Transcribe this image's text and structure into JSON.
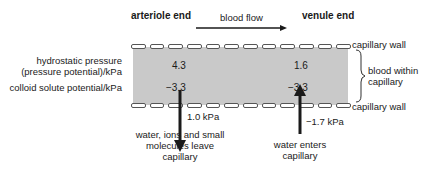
{
  "diagram": {
    "headers": {
      "arteriole": "arteriole end",
      "flow": "blood flow",
      "venule": "venule end"
    },
    "row_labels": {
      "hydrostatic_line1": "hydrostatic pressure",
      "hydrostatic_line2": "(pressure potential)/kPa",
      "colloid": "colloid solute potential/kPa"
    },
    "values": {
      "arteriole_hydrostatic": "4.3",
      "arteriole_colloid": "−3.3",
      "venule_hydrostatic": "1.6",
      "venule_colloid": "−3.3"
    },
    "side_labels": {
      "wall_top": "capillary wall",
      "blood_line1": "blood within",
      "blood_line2": "capillary",
      "wall_bottom": "capillary wall"
    },
    "arrows": {
      "out_pressure": "1.0 kPa",
      "in_pressure": "−1.7 kPa"
    },
    "captions": {
      "out_line1": "water, ions and small",
      "out_line2": "molecules leave",
      "out_line3": "capillary",
      "in_line1": "water enters",
      "in_line2": "capillary"
    },
    "colors": {
      "blood": "#c9c9c9",
      "ink": "#1a1a1a"
    }
  }
}
